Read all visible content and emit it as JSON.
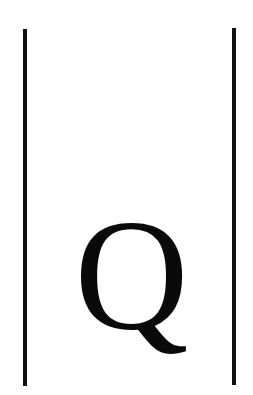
{
  "figure": {
    "symbol": "Q",
    "left_bar": "|",
    "right_bar": "|",
    "colors": {
      "ink": "#111111",
      "background": "#ffffff"
    }
  }
}
